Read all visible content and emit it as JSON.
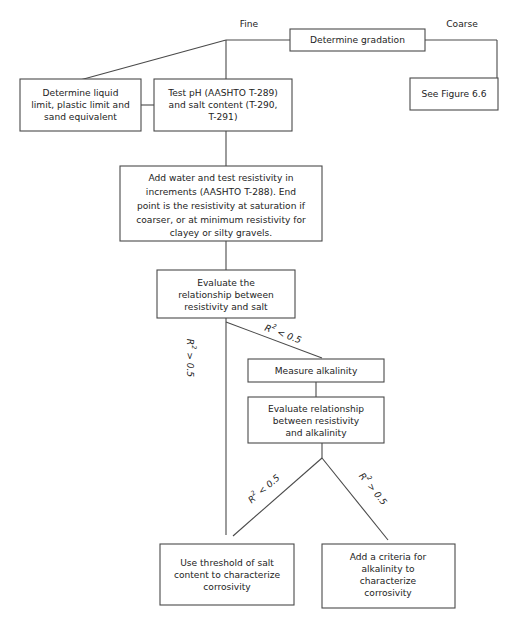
{
  "figure": {
    "line_color": "#4a4a4a",
    "text_color": "#232323",
    "background": "#ffffff"
  },
  "nodes": {
    "determine_gradation": {
      "id": "determine-gradation",
      "lines": [
        "Determine gradation"
      ]
    },
    "see_figure": {
      "id": "see-figure-6-6",
      "lines": [
        "See Figure 6.6"
      ]
    },
    "determine_liquid_limit": {
      "id": "determine-liquid-limit",
      "lines": [
        "Determine liquid",
        "limit, plastic limit and",
        "sand equivalent"
      ]
    },
    "test_ph": {
      "id": "test-ph-salt-content",
      "lines": [
        "Test pH (AASHTO T-289)",
        "and salt content (T-290,",
        "T-291)"
      ]
    },
    "add_water": {
      "id": "add-water-resistivity",
      "lines": [
        "Add water and test resistivity in",
        "increments (AASHTO T-288). End",
        "point is the resistivity at saturation if",
        "coarser, or at minimum resistivity for",
        "clayey or silty gravels."
      ]
    },
    "evaluate_salt": {
      "id": "evaluate-resistivity-salt",
      "lines": [
        "Evaluate the",
        "relationship between",
        "resistivity and salt"
      ]
    },
    "measure_alkalinity": {
      "id": "measure-alkalinity",
      "lines": [
        "Measure alkalinity"
      ]
    },
    "evaluate_alkalinity": {
      "id": "evaluate-resistivity-alkalinity",
      "lines": [
        "Evaluate relationship",
        "between resistivity",
        "and alkalinity"
      ]
    },
    "use_threshold": {
      "id": "use-threshold-salt",
      "lines": [
        "Use threshold of salt",
        "content to characterize",
        "corrosivity"
      ]
    },
    "add_criteria": {
      "id": "add-criteria-alkalinity",
      "lines": [
        "Add a criteria for",
        "alkalinity to",
        "characterize",
        "corrosivity"
      ]
    }
  },
  "edge_labels": {
    "fine": "Fine",
    "coarse": "Coarse",
    "r2_base": "R",
    "r2_exp": "2",
    "r2_gt_salt": " > 0.5",
    "r2_lt_salt": " < 0.5",
    "r2_lt_alk": " < 0.5",
    "r2_gt_alk": " > 0.5"
  }
}
